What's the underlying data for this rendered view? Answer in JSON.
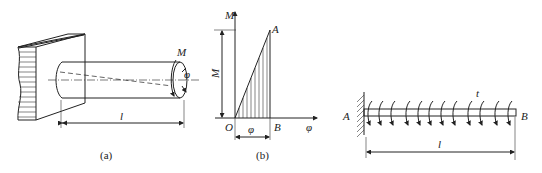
{
  "figure_a": {
    "caption": "(a)",
    "labels": {
      "moment": "M",
      "angle": "φ",
      "length": "l"
    }
  },
  "figure_b": {
    "caption": "(b)",
    "labels": {
      "y_axis": "M",
      "x_axis": "φ",
      "origin": "O",
      "point_a": "A",
      "point_b": "B",
      "height_dim": "M",
      "width_dim": "φ"
    }
  },
  "figure_c": {
    "labels": {
      "left_end": "A",
      "right_end": "B",
      "distributed_torque": "t",
      "length": "l"
    }
  },
  "colors": {
    "ink": "#222222",
    "background": "#ffffff"
  }
}
